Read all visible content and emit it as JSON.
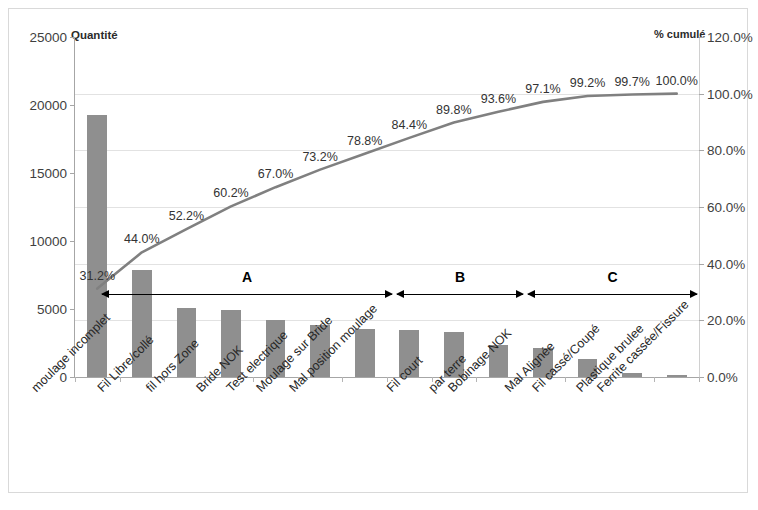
{
  "axes": {
    "left_title": "Quantité",
    "right_title": "% cumulé",
    "left_ticks": [
      "0",
      "5000",
      "10000",
      "15000",
      "20000",
      "25000"
    ],
    "right_ticks": [
      "0.0%",
      "20.0%",
      "40.0%",
      "60.0%",
      "80.0%",
      "100.0%",
      "120.0%"
    ]
  },
  "annotations": {
    "zones": [
      {
        "label": "A"
      },
      {
        "label": "B"
      },
      {
        "label": "C"
      }
    ]
  },
  "colors": {
    "bar": "#8f8f8f",
    "line": "#808080",
    "grid": "#e2e2e2",
    "axis": "#a6a6a6",
    "border": "#d9d9d9",
    "text": "#333333"
  },
  "chart_data": {
    "type": "bar",
    "title": "",
    "subtitle": "",
    "xlabel": "",
    "ylabel": "Quantité",
    "y2label": "% cumulé",
    "ylim": [
      0,
      25000
    ],
    "y2lim": [
      0,
      120
    ],
    "yticks": [
      0,
      5000,
      10000,
      15000,
      20000,
      25000
    ],
    "y2ticks": [
      0,
      20,
      40,
      60,
      80,
      100,
      120
    ],
    "grid": true,
    "legend": "none",
    "categories": [
      "moulage incomplet",
      "Fil Libre/collé",
      "fil hors Zone",
      "Bride NOK",
      "Test electrique",
      "Moulage sur Bride",
      "Mal position moulage",
      "Fil court",
      "par terre",
      "Bobinage NOK",
      "Mal Alignée",
      "Fil cassé/Coupé",
      "Plastique brulee",
      "Ferrite cassée/Fissure"
    ],
    "series": [
      {
        "name": "Quantité",
        "type": "bar",
        "axis": "left",
        "values": [
          19300,
          7850,
          5050,
          4950,
          4200,
          3850,
          3500,
          3450,
          3300,
          2350,
          2150,
          1350,
          300,
          150
        ]
      },
      {
        "name": "% cumulé",
        "type": "line",
        "axis": "right",
        "values": [
          31.2,
          44.0,
          52.2,
          60.2,
          67.0,
          73.2,
          78.8,
          84.4,
          89.8,
          93.6,
          97.1,
          99.2,
          99.7,
          100.0
        ],
        "data_labels": [
          "31.2%",
          "44.0%",
          "52.2%",
          "60.2%",
          "67.0%",
          "73.2%",
          "78.8%",
          "84.4%",
          "89.8%",
          "93.6%",
          "97.1%",
          "99.2%",
          "99.7%",
          "100.0%"
        ]
      }
    ]
  }
}
